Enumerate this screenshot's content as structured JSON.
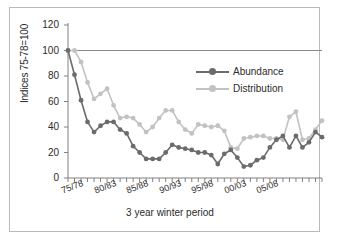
{
  "chart_data": {
    "type": "line",
    "title": "",
    "xlabel": "3 year winter period",
    "ylabel": "Indices 75-78=100",
    "ylim": [
      0,
      120
    ],
    "yticks": [
      0,
      20,
      40,
      60,
      80,
      100,
      120
    ],
    "grid": false,
    "reference_line": {
      "y": 100,
      "color": "#8a8a8a"
    },
    "legend_position": "upper-right",
    "xtick_labels": [
      "75/78",
      "80/83",
      "85/88",
      "90/93",
      "95/98",
      "00/03",
      "05/08"
    ],
    "xtick_indices": [
      0,
      5,
      10,
      15,
      20,
      25,
      30
    ],
    "categories": [
      "75/78",
      "76/79",
      "77/80",
      "78/81",
      "79/82",
      "80/83",
      "81/84",
      "82/85",
      "83/86",
      "84/87",
      "85/88",
      "86/89",
      "87/90",
      "88/91",
      "89/92",
      "90/93",
      "91/94",
      "92/95",
      "93/96",
      "94/97",
      "95/98",
      "96/99",
      "97/00",
      "98/01",
      "99/02",
      "00/03",
      "01/04",
      "02/05",
      "03/06",
      "04/07",
      "05/08",
      "06/09",
      "07/10",
      "08/11"
    ],
    "series": [
      {
        "name": "Abundance",
        "color": "#6b6b6b",
        "marker": "circle",
        "values": [
          100,
          81,
          61,
          44,
          36,
          41,
          44,
          44,
          38,
          35,
          25,
          20,
          15,
          15,
          15,
          20,
          26,
          24,
          23,
          22,
          20,
          20,
          18,
          11,
          19,
          22,
          16,
          9,
          10,
          14,
          16,
          24,
          30,
          33
        ]
      },
      {
        "name": "Distribution",
        "color": "#c2c2c2",
        "marker": "circle",
        "values": [
          100,
          100,
          91,
          75,
          62,
          66,
          70,
          57,
          47,
          48,
          47,
          42,
          36,
          40,
          47,
          53,
          53,
          44,
          38,
          35,
          42,
          41,
          40,
          41,
          37,
          24,
          23,
          31,
          32,
          33,
          33,
          31,
          31,
          30
        ]
      }
    ],
    "series_tail": {
      "note": "",
      "abundance_tail": [
        24,
        33,
        24,
        28,
        36,
        32
      ],
      "distribution_tail": [
        48,
        52,
        30,
        31,
        38,
        45
      ]
    }
  },
  "legend": {
    "items": [
      {
        "label": "Abundance"
      },
      {
        "label": "Distribution"
      }
    ]
  }
}
